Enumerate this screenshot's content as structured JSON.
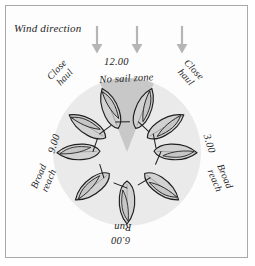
{
  "figure": {
    "kind": "points-of-sail-diagram",
    "labels": {
      "wind_direction": "Wind direction",
      "hour_12": "12.00",
      "hour_3": "3.00",
      "hour_6": "6.00",
      "hour_9": "9.00",
      "no_sail_zone": "No sail zone",
      "close_haul_left": "Close\nhaul",
      "close_haul_right": "Close\nhaul",
      "broad_reach_left": "Broad\nreach",
      "broad_reach_right": "Broad\nreach",
      "run": "Run"
    },
    "colors": {
      "page_background": "#ffffff",
      "frame_border": "#a9a9a9",
      "sail_circle": "#eaeaea",
      "no_sail_zone_wedge": "#c8c8c8",
      "boat_hull_fill": "#d2d2d2",
      "boat_outline": "#1f1f1f",
      "wind_arrow": "#b5b5b5",
      "text": "#262626"
    },
    "wind_arrows": [
      {
        "name": "wind-arrow-left",
        "x": 97,
        "y_top": 26,
        "y_bottom": 52
      },
      {
        "name": "wind-arrow-center",
        "x": 137,
        "y_top": 26,
        "y_bottom": 52
      },
      {
        "name": "wind-arrow-right",
        "x": 182,
        "y_top": 26,
        "y_bottom": 52
      }
    ],
    "circle": {
      "cx": 127,
      "cy": 152,
      "r": 74
    },
    "wedge": {
      "apex_x": 127,
      "apex_y": 152,
      "half_angle_deg": 22,
      "top_y": 78
    },
    "boats": [
      {
        "name": "boat-close-haul-port-upper",
        "cx": 110,
        "cy": 108,
        "rotation_deg": -22
      },
      {
        "name": "boat-close-haul-port-lower",
        "cx": 87,
        "cy": 124,
        "rotation_deg": -58
      },
      {
        "name": "boat-beam-reach-port",
        "cx": 77,
        "cy": 152,
        "rotation_deg": -90
      },
      {
        "name": "boat-broad-reach-port",
        "cx": 90,
        "cy": 187,
        "rotation_deg": -127
      },
      {
        "name": "boat-run",
        "cx": 127,
        "cy": 203,
        "rotation_deg": 180
      },
      {
        "name": "boat-broad-reach-starboard",
        "cx": 164,
        "cy": 187,
        "rotation_deg": 127
      },
      {
        "name": "boat-beam-reach-starboard",
        "cx": 177,
        "cy": 152,
        "rotation_deg": 90
      },
      {
        "name": "boat-close-haul-starboard-lower",
        "cx": 167,
        "cy": 124,
        "rotation_deg": 58
      },
      {
        "name": "boat-close-haul-starboard-upper",
        "cx": 144,
        "cy": 108,
        "rotation_deg": 22
      }
    ]
  }
}
